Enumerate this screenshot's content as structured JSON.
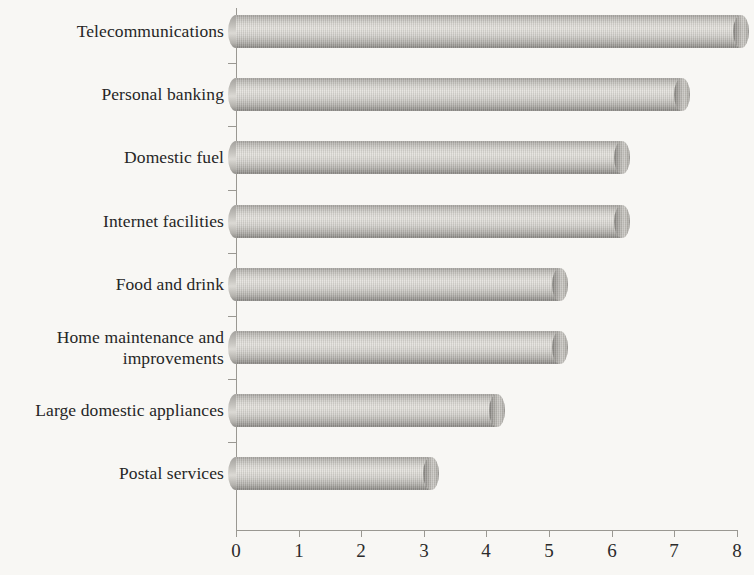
{
  "chart_data": {
    "type": "bar",
    "orientation": "horizontal",
    "title": "",
    "subtitle": "",
    "xlabel": "",
    "ylabel": "",
    "xlim": [
      0,
      8
    ],
    "xticks": [
      "0",
      "1",
      "2",
      "3",
      "4",
      "5",
      "6",
      "7",
      "8"
    ],
    "xtick_values": [
      0,
      1,
      2,
      3,
      4,
      5,
      6,
      7,
      8
    ],
    "grid": false,
    "legend": null,
    "bar_style": "3d-cylinder",
    "bar_color": "#c9c7c2",
    "axis_color": "#9a9892",
    "background_color": "#f8f7f4",
    "text_color": "#262626",
    "categories": [
      "Telecommunications",
      "Personal banking",
      "Domestic fuel",
      "Internet facilities",
      "Food and drink",
      "Home maintenance and improvements",
      "Large domestic appliances",
      "Postal services"
    ],
    "values": [
      8.2,
      7.25,
      6.3,
      6.3,
      5.3,
      5.3,
      4.3,
      3.25
    ]
  }
}
